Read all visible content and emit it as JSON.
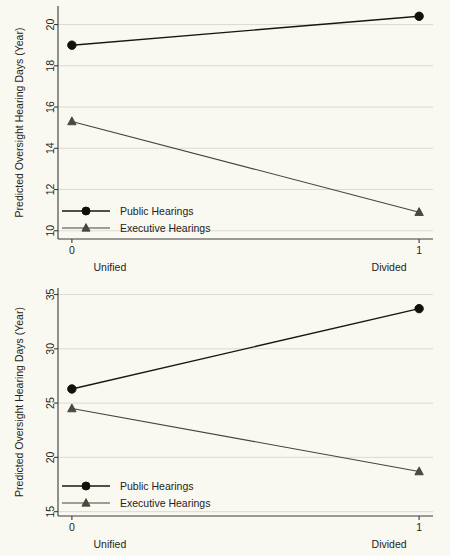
{
  "figure": {
    "background_color": "#faf9f1",
    "line_color_public": "#17170f",
    "line_color_executive": "#44443a",
    "grid_color": "#d8d7ce",
    "axis_color": "#3a3a38"
  },
  "chart_data": [
    {
      "type": "line",
      "panel": "top",
      "title": "",
      "xlabel": "",
      "ylabel": "Predicted Oversight Hearing Days (Year)",
      "x": [
        0,
        1
      ],
      "xtick_labels": [
        "0",
        "1"
      ],
      "category_labels": [
        "Unified",
        "Divided"
      ],
      "ytick_labels": [
        "10",
        "12",
        "14",
        "16",
        "18",
        "20"
      ],
      "yticks": [
        10,
        12,
        14,
        16,
        18,
        20
      ],
      "ylim": [
        9.6,
        20.9
      ],
      "xlim": [
        -0.04,
        1.04
      ],
      "grid": true,
      "grid_axis": "y",
      "legend_position": "lower-left",
      "series": [
        {
          "name": "Public Hearings",
          "marker": "circle",
          "values": [
            19.0,
            20.4
          ]
        },
        {
          "name": "Executive Hearings",
          "marker": "triangle",
          "values": [
            15.3,
            10.9
          ]
        }
      ]
    },
    {
      "type": "line",
      "panel": "bottom",
      "title": "",
      "xlabel": "",
      "ylabel": "Predicted Oversight Hearing Days (Year)",
      "x": [
        0,
        1
      ],
      "xtick_labels": [
        "0",
        "1"
      ],
      "category_labels": [
        "Unified",
        "Divided"
      ],
      "ytick_labels": [
        "15",
        "20",
        "25",
        "30",
        "35"
      ],
      "yticks": [
        15,
        20,
        25,
        30,
        35
      ],
      "ylim": [
        14.6,
        35.6
      ],
      "xlim": [
        -0.04,
        1.04
      ],
      "grid": true,
      "grid_axis": "y",
      "legend_position": "lower-left",
      "series": [
        {
          "name": "Public Hearings",
          "marker": "circle",
          "values": [
            26.3,
            33.7
          ]
        },
        {
          "name": "Executive Hearings",
          "marker": "triangle",
          "values": [
            24.5,
            18.7
          ]
        }
      ]
    }
  ]
}
